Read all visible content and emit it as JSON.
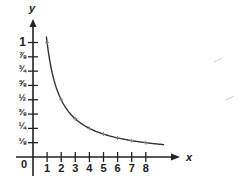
{
  "chart_data": {
    "type": "line",
    "title": "",
    "function": "y = 1/x",
    "xlabel": "x",
    "ylabel": "y",
    "origin_label": "0",
    "x_ticks": [
      "1",
      "2",
      "3",
      "4",
      "5",
      "6",
      "7",
      "8"
    ],
    "y_ticks": [
      "1/8",
      "1/4",
      "3/8",
      "1/2",
      "5/8",
      "3/4",
      "7/8",
      "1"
    ],
    "y_tick_display": [
      "⅛",
      "¼",
      "⅜",
      "½",
      "⅝",
      "¾",
      "⅞",
      "1"
    ],
    "x": [
      1,
      2,
      3,
      4,
      5,
      6,
      7,
      8
    ],
    "series": [
      {
        "name": "y = 1/x",
        "values": [
          1,
          0.5,
          0.3333,
          0.25,
          0.2,
          0.1667,
          0.1429,
          0.125
        ],
        "markers": true
      }
    ],
    "curve_domain": [
      0.95,
      9.3
    ],
    "xlim": [
      0,
      9.5
    ],
    "ylim": [
      0,
      1.15
    ],
    "grid": false,
    "legend": "none"
  },
  "colors": {
    "axis": "#222222",
    "curve": "#333333",
    "marker": "#888888"
  }
}
